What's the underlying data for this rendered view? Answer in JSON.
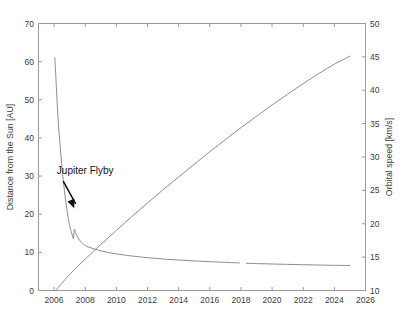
{
  "chart_data": {
    "type": "line",
    "title": "",
    "xlabel": "",
    "ylabel": "Distance from the Sun [AU]",
    "y2label": "Orbital speed [km/s]",
    "xlim": [
      2005,
      2026
    ],
    "ylim": [
      0,
      70
    ],
    "y2lim": [
      10,
      50
    ],
    "grid": false,
    "legend": "none",
    "xticks": [
      2006,
      2008,
      2010,
      2012,
      2014,
      2016,
      2018,
      2020,
      2022,
      2024,
      2026
    ],
    "xticklabels": [
      "2006",
      "2008",
      "2010",
      "2012",
      "2014",
      "2016",
      "2018",
      "2020",
      "2022",
      "2024",
      "2026"
    ],
    "yticks": [
      0,
      10,
      20,
      30,
      40,
      50,
      60,
      70
    ],
    "yticklabels": [
      "0",
      "10",
      "20",
      "30",
      "40",
      "50",
      "60",
      "70"
    ],
    "y2ticks": [
      10,
      15,
      20,
      25,
      30,
      35,
      40,
      45,
      50
    ],
    "y2ticklabels": [
      "10",
      "15",
      "20",
      "25",
      "30",
      "35",
      "40",
      "45",
      "50"
    ],
    "annotations": [
      {
        "label": "Jupiter Flyby",
        "text_x": 2008.0,
        "text_y": 30.5,
        "point_x": 2007.25,
        "point_y": 22.0
      }
    ],
    "series": [
      {
        "name": "Distance from the Sun",
        "axis": "left",
        "unit": "AU",
        "x": [
          2006.05,
          2006.12,
          2006.2,
          2006.3,
          2006.42,
          2006.55,
          2006.7,
          2006.85,
          2007.0,
          2007.1,
          2007.18,
          2007.24,
          2007.3,
          2007.38,
          2007.5,
          2007.7,
          2008.0,
          2008.5,
          2009.0,
          2009.5,
          2010.0,
          2010.5,
          2011.0,
          2012.0,
          2013.0,
          2014.0,
          2015.0,
          2016.0,
          2017.0,
          2017.9,
          2018.35,
          2019.0,
          2020.0,
          2021.0,
          2022.0,
          2023.0,
          2024.0,
          2025.0
        ],
        "y": [
          61.0,
          55.5,
          49.0,
          42.5,
          36.5,
          30.5,
          25.0,
          20.5,
          17.0,
          15.4,
          14.4,
          13.6,
          16.0,
          15.2,
          14.1,
          12.9,
          11.8,
          11.0,
          10.4,
          9.95,
          9.6,
          9.3,
          9.05,
          8.6,
          8.25,
          8.0,
          7.75,
          7.55,
          7.38,
          7.22,
          7.15,
          7.05,
          6.95,
          6.85,
          6.76,
          6.68,
          6.6,
          6.55
        ],
        "gap_after_x": 2017.9
      },
      {
        "name": "Orbital speed",
        "axis": "right",
        "unit": "km/s",
        "x": [
          2006.1,
          2007.0,
          2008.0,
          2009.0,
          2010.0,
          2011.0,
          2012.0,
          2013.0,
          2014.0,
          2015.0,
          2016.0,
          2017.0,
          2018.0,
          2019.0,
          2020.0,
          2021.0,
          2022.0,
          2023.0,
          2024.0,
          2025.0
        ],
        "y": [
          10.0,
          12.4,
          14.7,
          16.9,
          19.0,
          21.1,
          23.1,
          25.1,
          27.0,
          28.9,
          30.8,
          32.6,
          34.4,
          36.1,
          37.8,
          39.4,
          41.0,
          42.5,
          43.9,
          45.1
        ]
      }
    ]
  }
}
